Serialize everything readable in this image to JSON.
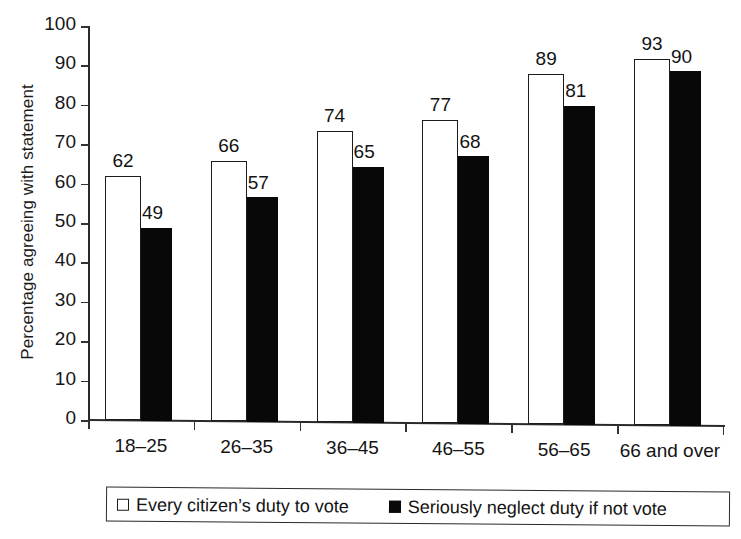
{
  "chart_data": {
    "type": "bar",
    "title": "",
    "xlabel": "",
    "ylabel": "Percentage agreeing with statement",
    "ylim": [
      0,
      100
    ],
    "yticks": [
      0,
      10,
      20,
      30,
      40,
      50,
      60,
      70,
      80,
      90,
      100
    ],
    "grid": false,
    "legend_position": "bottom",
    "categories": [
      "18–25",
      "26–35",
      "36–45",
      "46–55",
      "56–65",
      "66 and over"
    ],
    "series": [
      {
        "name": "Every citizen's duty to vote",
        "style": "open",
        "color": "#ffffff",
        "edge_color": "#1c1c1c",
        "values": [
          62,
          66,
          74,
          77,
          89,
          93
        ]
      },
      {
        "name": "Seriously neglect duty if not vote",
        "style": "filled",
        "color": "#080808",
        "edge_color": "#080808",
        "values": [
          49,
          57,
          65,
          68,
          81,
          90
        ]
      }
    ]
  },
  "legend": {
    "items": [
      {
        "label": "Every citizen’s duty to vote",
        "swatch": "open-square"
      },
      {
        "label": "Seriously neglect duty if not vote",
        "swatch": "filled-square"
      }
    ]
  }
}
